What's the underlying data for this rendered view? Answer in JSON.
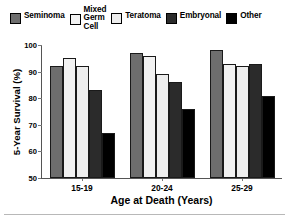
{
  "chart_data": {
    "type": "bar",
    "title": "",
    "xlabel": "Age at Death (Years)",
    "ylabel": "5-Year Survival (%)",
    "categories": [
      "15-19",
      "20-24",
      "25-29"
    ],
    "ylim": [
      50,
      100
    ],
    "yticks": [
      50,
      60,
      70,
      80,
      90,
      100
    ],
    "grid": false,
    "legend_position": "top",
    "series": [
      {
        "name": "Seminoma",
        "color": "#6e6e6e",
        "values": [
          92,
          97,
          98
        ]
      },
      {
        "name": "Mixed\nGerm\nCell",
        "color": "#f2f2f2",
        "values": [
          95,
          96,
          93
        ]
      },
      {
        "name": "Teratoma",
        "color": "#ededed",
        "values": [
          92,
          89,
          92
        ]
      },
      {
        "name": "Embryonal",
        "color": "#2b2b2b",
        "values": [
          83,
          86,
          93
        ]
      },
      {
        "name": "Other",
        "color": "#000000",
        "values": [
          67,
          76,
          81
        ]
      }
    ]
  },
  "legend": {
    "items": [
      {
        "label": "Seminoma",
        "color": "#6e6e6e",
        "multiline": false
      },
      {
        "label": "Mixed\nGerm\nCell",
        "color": "#f2f2f2",
        "multiline": true
      },
      {
        "label": "Teratoma",
        "color": "#ededed",
        "multiline": false
      },
      {
        "label": "Embryonal",
        "color": "#2b2b2b",
        "multiline": false
      },
      {
        "label": "Other",
        "color": "#000000",
        "multiline": false
      }
    ]
  }
}
